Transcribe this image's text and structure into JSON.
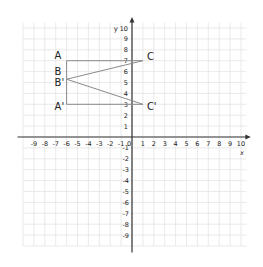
{
  "diagram": {
    "type": "coordinate-plane-reflection",
    "axes": {
      "x_label": "x",
      "y_label": "y",
      "x_ticks": [
        "-9",
        "-8",
        "-7",
        "-6",
        "-5",
        "-4",
        "-3",
        "-2",
        "-1",
        "0",
        "1",
        "2",
        "3",
        "4",
        "5",
        "6",
        "7",
        "8",
        "9",
        "10"
      ],
      "y_ticks_positive": [
        "1",
        "2",
        "3",
        "4",
        "5",
        "6",
        "7",
        "8",
        "9",
        "10"
      ],
      "y_ticks_negative": [
        "-1",
        "-2",
        "-3",
        "-4",
        "-5",
        "-6",
        "-7",
        "-8",
        "-9"
      ],
      "x_range": [
        -10,
        10
      ],
      "y_range": [
        -10,
        10
      ]
    },
    "points": [
      {
        "label": "A",
        "x": -6,
        "y": 7
      },
      {
        "label": "B",
        "x": -6,
        "y": 5.3
      },
      {
        "label": "C",
        "x": 1,
        "y": 7
      },
      {
        "label": "A'",
        "x": -6,
        "y": 3
      },
      {
        "label": "B'",
        "x": -6,
        "y": 5.3
      },
      {
        "label": "C'",
        "x": 1,
        "y": 3
      }
    ],
    "segments": [
      [
        "A",
        "C"
      ],
      [
        "A",
        "A'"
      ],
      [
        "B",
        "C"
      ],
      [
        "B'",
        "C'"
      ],
      [
        "A'",
        "C'"
      ]
    ],
    "colors": {
      "grid": "#e4e4e4",
      "axis": "#333333",
      "shape": "#8a8a8a",
      "text": "#222222"
    }
  }
}
